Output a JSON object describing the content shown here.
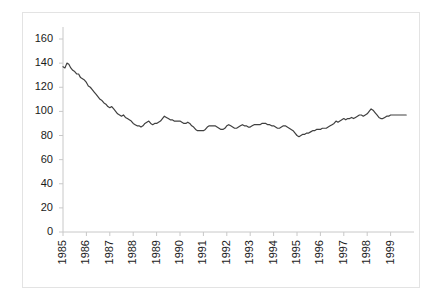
{
  "chart_data": {
    "type": "line",
    "title": "",
    "subtitle": "",
    "xlabel": "",
    "ylabel": "",
    "ylim": [
      0,
      160
    ],
    "ytick_labels": [
      "160",
      "140",
      "120",
      "100",
      "80",
      "60",
      "40",
      "20",
      "0"
    ],
    "ytick_values": [
      160,
      140,
      120,
      100,
      80,
      60,
      40,
      20,
      0
    ],
    "xtick_labels": [
      "1985",
      "1986",
      "1987",
      "1988",
      "1989",
      "1990",
      "1991",
      "1992",
      "1993",
      "1994",
      "1995",
      "1996",
      "1997",
      "1998",
      "1999"
    ],
    "xtick_values": [
      1985,
      1986,
      1987,
      1988,
      1989,
      1990,
      1991,
      1992,
      1993,
      1994,
      1995,
      1996,
      1997,
      1998,
      1999
    ],
    "grid": false,
    "legend": null,
    "legend_position": "none",
    "line_color": "#404040",
    "series": [
      {
        "name": "series-1",
        "x": [
          1985.0,
          1985.083,
          1985.167,
          1985.25,
          1985.333,
          1985.417,
          1985.5,
          1985.583,
          1985.667,
          1985.75,
          1985.833,
          1985.917,
          1986.0,
          1986.083,
          1986.167,
          1986.25,
          1986.333,
          1986.417,
          1986.5,
          1986.583,
          1986.667,
          1986.75,
          1986.833,
          1986.917,
          1987.0,
          1987.083,
          1987.167,
          1987.25,
          1987.333,
          1987.417,
          1987.5,
          1987.583,
          1987.667,
          1987.75,
          1987.833,
          1987.917,
          1988.0,
          1988.083,
          1988.167,
          1988.25,
          1988.333,
          1988.417,
          1988.5,
          1988.583,
          1988.667,
          1988.75,
          1988.833,
          1988.917,
          1989.0,
          1989.083,
          1989.167,
          1989.25,
          1989.333,
          1989.417,
          1989.5,
          1989.583,
          1989.667,
          1989.75,
          1989.833,
          1989.917,
          1990.0,
          1990.083,
          1990.167,
          1990.25,
          1990.333,
          1990.417,
          1990.5,
          1990.583,
          1990.667,
          1990.75,
          1990.833,
          1990.917,
          1991.0,
          1991.083,
          1991.167,
          1991.25,
          1991.333,
          1991.417,
          1991.5,
          1991.583,
          1991.667,
          1991.75,
          1991.833,
          1991.917,
          1992.0,
          1992.083,
          1992.167,
          1992.25,
          1992.333,
          1992.417,
          1992.5,
          1992.583,
          1992.667,
          1992.75,
          1992.833,
          1992.917,
          1993.0,
          1993.083,
          1993.167,
          1993.25,
          1993.333,
          1993.417,
          1993.5,
          1993.583,
          1993.667,
          1993.75,
          1993.833,
          1993.917,
          1994.0,
          1994.083,
          1994.167,
          1994.25,
          1994.333,
          1994.417,
          1994.5,
          1994.583,
          1994.667,
          1994.75,
          1994.833,
          1994.917,
          1995.0,
          1995.083,
          1995.167,
          1995.25,
          1995.333,
          1995.417,
          1995.5,
          1995.583,
          1995.667,
          1995.75,
          1995.833,
          1995.917,
          1996.0,
          1996.083,
          1996.167,
          1996.25,
          1996.333,
          1996.417,
          1996.5,
          1996.583,
          1996.667,
          1996.75,
          1996.833,
          1996.917,
          1997.0,
          1997.083,
          1997.167,
          1997.25,
          1997.333,
          1997.417,
          1997.5,
          1997.583,
          1997.667,
          1997.75,
          1997.833,
          1997.917,
          1998.0,
          1998.083,
          1998.167,
          1998.25,
          1998.333,
          1998.417,
          1998.5,
          1998.583,
          1998.667,
          1998.75,
          1998.833,
          1998.917,
          1999.0,
          1999.083,
          1999.167,
          1999.25,
          1999.333,
          1999.417,
          1999.5,
          1999.583,
          1999.667
        ],
        "values": [
          137,
          136,
          140,
          139,
          136,
          134,
          133,
          131,
          131,
          128,
          127,
          126,
          124,
          121,
          120,
          118,
          116,
          114,
          112,
          110,
          109,
          107,
          106,
          104,
          103,
          104,
          102,
          100,
          98,
          97,
          96,
          97,
          95,
          94,
          93,
          92,
          90,
          89,
          88,
          88,
          87,
          88,
          90,
          91,
          92,
          90,
          89,
          90,
          90,
          91,
          92,
          94,
          96,
          95,
          94,
          93,
          93,
          92,
          92,
          92,
          92,
          91,
          90,
          90,
          91,
          90,
          88,
          87,
          85,
          84,
          84,
          84,
          84,
          85,
          87,
          88,
          88,
          88,
          88,
          87,
          86,
          85,
          85,
          86,
          88,
          89,
          88,
          87,
          86,
          86,
          87,
          88,
          89,
          88,
          88,
          87,
          87,
          88,
          89,
          89,
          89,
          89,
          90,
          90,
          90,
          89,
          89,
          88,
          88,
          87,
          86,
          86,
          87,
          88,
          88,
          87,
          86,
          85,
          84,
          82,
          80,
          79,
          80,
          81,
          81,
          82,
          82,
          83,
          84,
          84,
          85,
          85,
          85,
          86,
          86,
          86,
          87,
          88,
          89,
          90,
          92,
          91,
          92,
          93,
          94,
          93,
          94,
          94,
          95,
          94,
          95,
          96,
          97,
          97,
          96,
          97,
          98,
          100,
          102,
          101,
          99,
          97,
          95,
          94,
          94,
          95,
          96,
          96,
          97,
          97,
          97,
          97,
          97,
          97,
          97,
          97,
          97
        ]
      }
    ]
  },
  "axes": {
    "y_axis_name": "y-axis",
    "x_axis_name": "x-axis"
  }
}
